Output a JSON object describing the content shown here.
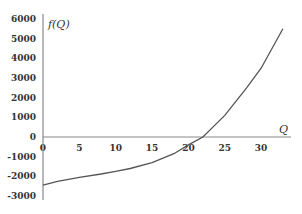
{
  "chart_data": {
    "type": "line",
    "title": "",
    "xlabel": "Q",
    "ylabel": "f(Q)",
    "xlim": [
      0,
      34
    ],
    "ylim": [
      -3000,
      6000
    ],
    "x_ticks": [
      "0",
      "5",
      "10",
      "15",
      "20",
      "25",
      "30"
    ],
    "y_ticks": [
      "6000",
      "5000",
      "4000",
      "3000",
      "2000",
      "1000",
      "0",
      "-1000",
      "-2000",
      "-3000"
    ],
    "grid": false,
    "series": [
      {
        "name": "f(Q)",
        "x": [
          0,
          2,
          5,
          8,
          10,
          12,
          15,
          18,
          20,
          22,
          25,
          28,
          30,
          33
        ],
        "values": [
          -2450,
          -2250,
          -2050,
          -1880,
          -1750,
          -1600,
          -1300,
          -850,
          -400,
          0,
          1100,
          2500,
          3500,
          5500
        ]
      }
    ]
  }
}
